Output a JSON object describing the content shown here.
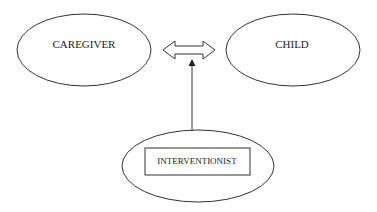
{
  "diagram": {
    "nodes": [
      {
        "id": "caregiver",
        "label": "CAREGIVER",
        "shape": "ellipse"
      },
      {
        "id": "child",
        "label": "CHILD",
        "shape": "ellipse"
      },
      {
        "id": "interventionist",
        "label": "INTERVENTIONIST",
        "shape": "ellipse-with-inner-rectangle"
      }
    ],
    "edges": [
      {
        "from": "caregiver",
        "to": "child",
        "type": "bidirectional-hollow-arrow"
      },
      {
        "from": "interventionist",
        "to": "caregiver-child-relationship",
        "type": "single-solid-arrow"
      }
    ],
    "colors": {
      "stroke": "#333333",
      "text": "#222222",
      "background": "#ffffff"
    }
  }
}
